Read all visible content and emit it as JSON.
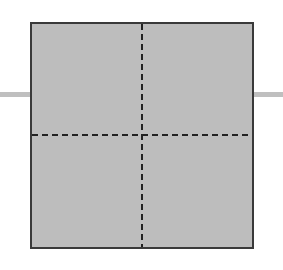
{
  "diagram": {
    "type": "quadrant-square",
    "canvas": {
      "width": 283,
      "height": 270,
      "background": "#ffffff"
    },
    "square": {
      "x": 30,
      "y": 22,
      "width": 224,
      "height": 227,
      "fill": "#bdbdbd",
      "border": "#3a3a3a",
      "border_width": 2
    },
    "divider_vertical": {
      "x": 142,
      "color": "#222222",
      "dash": 6,
      "gap": 4,
      "width": 2
    },
    "divider_horizontal": {
      "y": 135,
      "color": "#222222",
      "dash": 6,
      "gap": 4,
      "width": 2
    },
    "stubs": [
      {
        "side": "left",
        "x": 0,
        "y": 92,
        "width": 30,
        "height": 5,
        "color": "#bfbfbf"
      },
      {
        "side": "right",
        "x": 254,
        "y": 92,
        "width": 29,
        "height": 5,
        "color": "#bfbfbf"
      }
    ],
    "quadrants": [
      "top-left",
      "top-right",
      "bottom-left",
      "bottom-right"
    ]
  }
}
